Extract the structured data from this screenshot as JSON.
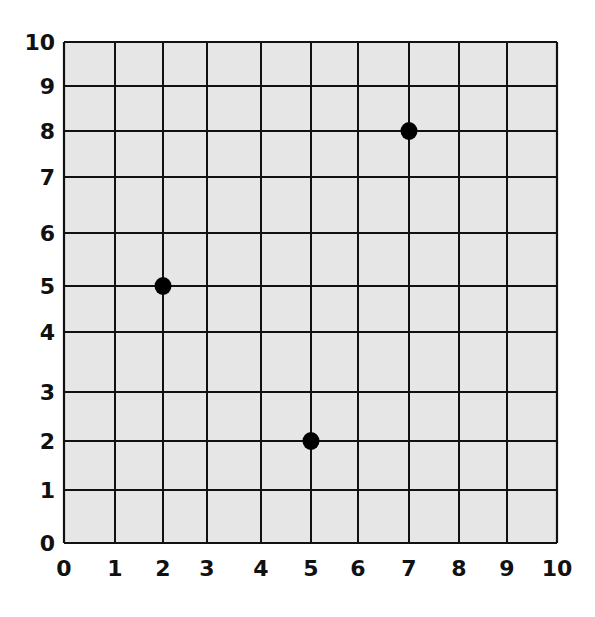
{
  "chart_data": {
    "type": "scatter",
    "title": "",
    "xlabel": "",
    "ylabel": "",
    "xlim": [
      0,
      10
    ],
    "ylim": [
      0,
      10
    ],
    "grid": true,
    "legend": null,
    "x_ticks": [
      "0",
      "1",
      "2",
      "3",
      "4",
      "5",
      "6",
      "7",
      "8",
      "9",
      "10"
    ],
    "y_ticks": [
      "0",
      "1",
      "2",
      "3",
      "4",
      "5",
      "6",
      "7",
      "8",
      "9",
      "10"
    ],
    "series": [
      {
        "name": "points",
        "points": [
          {
            "x": 2,
            "y": 5
          },
          {
            "x": 5,
            "y": 2
          },
          {
            "x": 7,
            "y": 8
          }
        ]
      }
    ]
  },
  "style": {
    "plot_fill": "#e6e6e6",
    "grid_color": "#111111",
    "point_color": "#000000"
  },
  "layout": {
    "x_pixels": [
      64,
      115,
      163,
      207,
      261,
      311,
      358,
      409,
      459,
      507,
      557
    ],
    "y_pixels": [
      543,
      490,
      441,
      392,
      332,
      286,
      233,
      177,
      131,
      86,
      42
    ]
  }
}
